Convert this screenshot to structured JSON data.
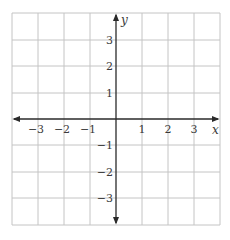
{
  "diagram": {
    "type": "coordinate-plane",
    "x_axis": {
      "label": "x",
      "ticks": [
        "−3",
        "−2",
        "−1",
        "1",
        "2",
        "3"
      ]
    },
    "y_axis": {
      "label": "y",
      "ticks": [
        "3",
        "2",
        "1",
        "−1",
        "−2",
        "−3"
      ]
    },
    "range": {
      "x": [
        -4,
        4
      ],
      "y": [
        -4,
        4
      ]
    },
    "grid": true,
    "colors": {
      "grid": "#c4c4c4",
      "axis": "#2a2a2a"
    }
  }
}
